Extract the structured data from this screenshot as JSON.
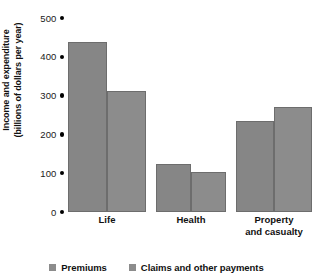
{
  "chart_data": {
    "type": "bar",
    "title": "",
    "xlabel": "",
    "ylabel_lines": [
      "Income and expenditure",
      "(billions of dollars per year)"
    ],
    "ylabel": "Income and expenditure (billions of dollars per year)",
    "ylim": [
      0,
      500
    ],
    "ytick_values": [
      0,
      100,
      200,
      300,
      400,
      500
    ],
    "ytick_labels": [
      "0",
      "100",
      "200",
      "300",
      "400",
      "500"
    ],
    "grid": false,
    "legend_position": "bottom",
    "categories": [
      "Life",
      "Health",
      "Property and casualty"
    ],
    "category_label_lines": [
      [
        "Life"
      ],
      [
        "Health"
      ],
      [
        "Property",
        "and casualty"
      ]
    ],
    "series": [
      {
        "name": "Premiums",
        "color": "#868686",
        "values": [
          430,
          120,
          230
        ]
      },
      {
        "name": "Claims and other payments",
        "color": "#8c8c8c",
        "values": [
          305,
          100,
          265
        ]
      }
    ]
  },
  "legend": {
    "items": [
      {
        "label": "Premiums",
        "swatch_color": "#8c8c8c",
        "swatch_icon": "square-swatch-icon"
      },
      {
        "label": "Claims and other payments",
        "swatch_color": "#8c8c8c",
        "swatch_icon": "square-swatch-icon"
      }
    ]
  },
  "axis": {
    "tick_marker_icon": "dot-marker-icon",
    "tick_marker_color": "#000000"
  }
}
